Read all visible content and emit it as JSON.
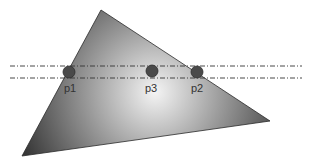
{
  "canvas": {
    "width": 313,
    "height": 167,
    "background": "#ffffff"
  },
  "triangle": {
    "vertices": [
      [
        101,
        10
      ],
      [
        270,
        121
      ],
      [
        22,
        156
      ]
    ],
    "fill_center": "#f4f4f4",
    "fill_edge": "#3a3a3a",
    "gradient_center": [
      155,
      92
    ]
  },
  "scanlines": [
    {
      "y": 66,
      "x1": 10,
      "x2": 302,
      "color": "#333333"
    },
    {
      "y": 78,
      "x1": 10,
      "x2": 302,
      "color": "#333333"
    }
  ],
  "points": [
    {
      "id": "p1",
      "label": "p1",
      "cx": 69,
      "cy": 72,
      "r": 6,
      "label_x": 64,
      "label_y": 92
    },
    {
      "id": "p3",
      "label": "p3",
      "cx": 152,
      "cy": 71,
      "r": 6,
      "label_x": 145,
      "label_y": 92
    },
    {
      "id": "p2",
      "label": "p2",
      "cx": 197,
      "cy": 72,
      "r": 6,
      "label_x": 191,
      "label_y": 92
    }
  ],
  "point_style": {
    "fill": "#4a4a4a",
    "stroke": "#2e2e2e"
  }
}
